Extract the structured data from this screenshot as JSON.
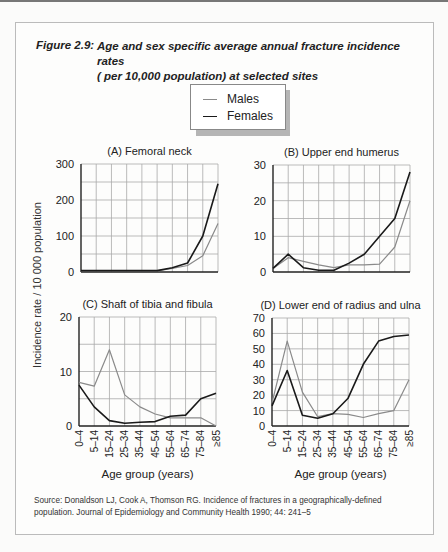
{
  "figure": {
    "label": "Figure 2.9:",
    "title_line1": "Age and sex specific average annual fracture incidence rates",
    "title_line2": "( per 10,000 population) at selected sites"
  },
  "legend": {
    "males": "Males",
    "females": "Females"
  },
  "colors": {
    "males": "#8a8a8a",
    "females": "#1a1a1a",
    "grid": "#aaaaaa",
    "axis": "#222222"
  },
  "ylabel": "Incidence rate / 10 000 population",
  "xlabel": "Age group (years)",
  "source_line1": "Source: Donaldson LJ, Cook A, Thomson RG. Incidence of fractures in a geographically-defined",
  "source_line2": "population. Journal of Epidemiology and Community Health 1990; 44: 241–5",
  "chart_data": [
    {
      "type": "line",
      "title": "(A) Femoral neck",
      "categories": [
        "0–4",
        "5–14",
        "15–24",
        "25–34",
        "35–44",
        "45–54",
        "55–64",
        "65–74",
        "75–84",
        "≥85"
      ],
      "series": [
        {
          "name": "Males",
          "values": [
            3,
            3,
            3,
            3,
            3,
            3,
            10,
            18,
            45,
            135
          ]
        },
        {
          "name": "Females",
          "values": [
            4,
            4,
            4,
            4,
            4,
            4,
            12,
            25,
            100,
            245
          ]
        }
      ],
      "xlabel": "",
      "ylabel": "Incidence rate / 10 000 population",
      "ylim": [
        0,
        300
      ],
      "yticks": [
        0,
        100,
        200,
        300
      ],
      "grid_step": 50
    },
    {
      "type": "line",
      "title": "(B) Upper end humerus",
      "categories": [
        "0–4",
        "5–14",
        "15–24",
        "25–34",
        "35–44",
        "45–54",
        "55–64",
        "65–74",
        "75–84",
        "≥85"
      ],
      "series": [
        {
          "name": "Males",
          "values": [
            1,
            4,
            3,
            2,
            1.2,
            2,
            2,
            2.2,
            7,
            20
          ]
        },
        {
          "name": "Females",
          "values": [
            1,
            5,
            1.2,
            0.5,
            0.5,
            2.5,
            5,
            10,
            15,
            28
          ]
        }
      ],
      "ylim": [
        0,
        30
      ],
      "yticks": [
        0,
        10,
        20,
        30
      ],
      "grid_step": 5
    },
    {
      "type": "line",
      "title": "(C) Shaft of tibia and fibula",
      "categories": [
        "0–4",
        "5–14",
        "15–24",
        "25–34",
        "35–44",
        "45–54",
        "55–64",
        "65–74",
        "75–84",
        "≥85"
      ],
      "series": [
        {
          "name": "Males",
          "values": [
            8,
            7.3,
            14,
            5.7,
            3.5,
            2.2,
            1.5,
            1.5,
            1.5,
            0
          ]
        },
        {
          "name": "Females",
          "values": [
            7.5,
            3.5,
            1,
            0.5,
            0.7,
            0.8,
            1.8,
            2,
            5,
            6
          ]
        }
      ],
      "xlabel": "Age group (years)",
      "ylim": [
        0,
        20
      ],
      "yticks": [
        0,
        10,
        20
      ],
      "grid_step": 5
    },
    {
      "type": "line",
      "title": "(D) Lower end of radius and ulna",
      "categories": [
        "0–4",
        "5–14",
        "15–24",
        "25–34",
        "35–44",
        "45–54",
        "55–64",
        "65–74",
        "75–84",
        "≥85"
      ],
      "series": [
        {
          "name": "Males",
          "values": [
            15,
            55,
            22,
            6,
            8,
            7.5,
            5.5,
            8,
            10,
            30
          ]
        },
        {
          "name": "Females",
          "values": [
            13,
            36,
            7,
            5,
            8,
            18,
            40,
            55,
            58,
            59
          ]
        }
      ],
      "xlabel": "Age group (years)",
      "ylim": [
        0,
        70
      ],
      "yticks": [
        0,
        10,
        20,
        30,
        40,
        50,
        60,
        70
      ],
      "grid_step": 10
    }
  ]
}
